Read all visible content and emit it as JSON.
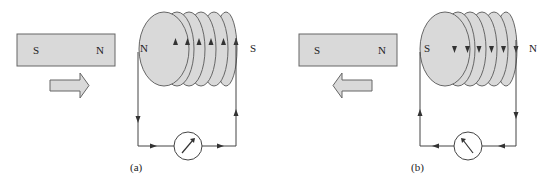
{
  "figure": {
    "panels": [
      {
        "id": "a",
        "caption": "(a)",
        "magnet": {
          "left_pole": "S",
          "right_pole": "N"
        },
        "motion_arrow": "right",
        "coil": {
          "left_pole": "N",
          "right_pole": "S",
          "turns": 6,
          "current_arrow_direction": "up"
        },
        "circuit": {
          "left_wire_arrow": "down",
          "bottom_arrows": "right",
          "right_wire_arrow": "up"
        },
        "galvanometer": {
          "needle": "deflects right"
        }
      },
      {
        "id": "b",
        "caption": "(b)",
        "magnet": {
          "left_pole": "S",
          "right_pole": "N"
        },
        "motion_arrow": "left",
        "coil": {
          "left_pole": "S",
          "right_pole": "N",
          "turns": 6,
          "current_arrow_direction": "down"
        },
        "circuit": {
          "left_wire_arrow": "up",
          "bottom_arrows": "left",
          "right_wire_arrow": "down"
        },
        "galvanometer": {
          "needle": "deflects left"
        }
      }
    ],
    "colors": {
      "fill": "#d9d9d9",
      "stroke": "#555555",
      "line": "#444444"
    }
  }
}
